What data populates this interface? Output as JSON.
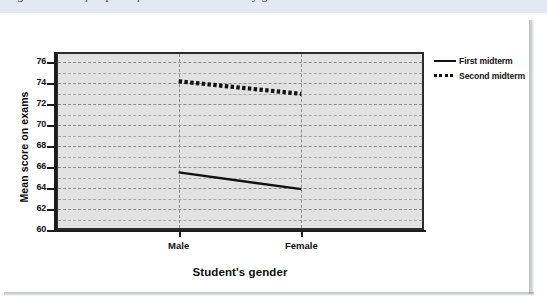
{
  "page": {
    "top_strip_cut_text": "Figure 9.4  Profile plot of mean exam scores by gender",
    "background_color": "#ffffff",
    "strip_color": "#e3e8f2"
  },
  "chart_data": {
    "type": "line",
    "title": "",
    "subtitle": "",
    "xlabel": "Student's gender",
    "ylabel": "Mean score on exams",
    "categories": [
      "Male",
      "Female"
    ],
    "series": [
      {
        "name": "First midterm",
        "values": [
          65.5,
          63.9
        ],
        "style": "solid"
      },
      {
        "name": "Second midterm",
        "values": [
          74.2,
          73.0
        ],
        "style": "dotted"
      }
    ],
    "ylim": [
      60,
      77
    ],
    "yticks": [
      60,
      62,
      64,
      66,
      68,
      70,
      72,
      74,
      76
    ],
    "ytick_labels": [
      "60",
      "62",
      "64",
      "66",
      "68",
      "70",
      "72",
      "74",
      "76"
    ],
    "minor_gridlines": [
      61,
      63,
      65,
      67,
      69,
      71,
      73,
      75
    ],
    "grid": true,
    "legend_position": "right",
    "plot_background": "#e2e2e2",
    "line_color": "#111111"
  },
  "legend": {
    "entries": [
      {
        "label": "First midterm",
        "marker": "solid-line-swatch"
      },
      {
        "label": "Second midterm",
        "marker": "dotted-line-swatch"
      }
    ]
  },
  "axes": {
    "y_title": "Mean score on exams",
    "x_title": "Student's gender",
    "x_categories": [
      "Male",
      "Female"
    ]
  }
}
